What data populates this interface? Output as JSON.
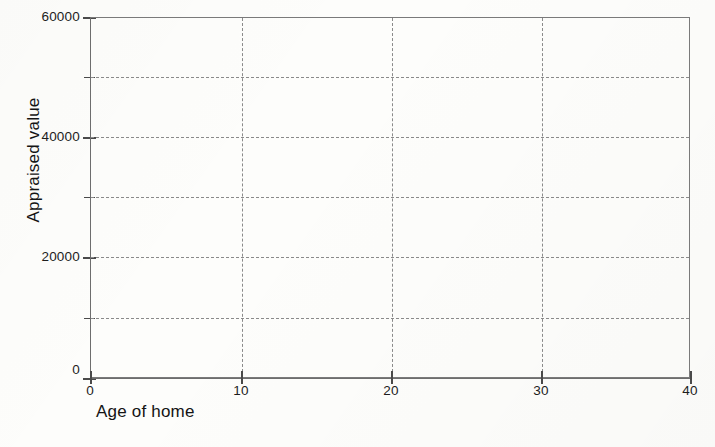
{
  "chart_data": {
    "type": "scatter",
    "title": "",
    "subtitle": "",
    "xlabel": "Age of home",
    "ylabel": "Appraised value",
    "xlim": [
      0,
      40
    ],
    "ylim": [
      0,
      60000
    ],
    "x_ticks": [
      0,
      10,
      20,
      30,
      40
    ],
    "x_tick_labels": [
      "0",
      "10",
      "20",
      "30",
      "40"
    ],
    "y_ticks": [
      0,
      10000,
      20000,
      30000,
      40000,
      50000,
      60000
    ],
    "y_tick_labels": [
      "0",
      "",
      "20000",
      "",
      "40000",
      "",
      "60000"
    ],
    "y_labeled_ticks": [
      {
        "value": 0,
        "label": "0"
      },
      {
        "value": 20000,
        "label": "20000"
      },
      {
        "value": 40000,
        "label": "40000"
      },
      {
        "value": 60000,
        "label": "60000"
      }
    ],
    "x_minor_interval": 10,
    "y_minor_interval": 10000,
    "grid": true,
    "grid_style": "dashed",
    "legend": null,
    "legend_position": "none",
    "series": [
      {
        "name": "",
        "points": []
      }
    ],
    "values": [],
    "annotations": [],
    "note": "Empty plotting grid — no data points are drawn in the axes area."
  },
  "axes": {
    "y_title": "Appraised value",
    "x_title": "Age of home",
    "origin_y_label": "0",
    "origin_x_label": "0"
  },
  "colors": {
    "background": "#fdfdfb",
    "axis": "#6d6d6d",
    "grid": "#8a8a8a",
    "text": "#1d1d1d"
  }
}
